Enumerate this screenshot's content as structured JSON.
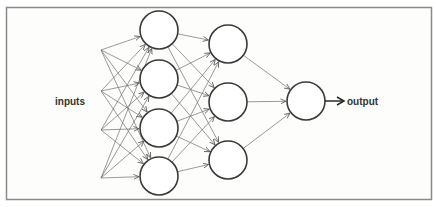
{
  "diagram": {
    "labels": {
      "inputs": "inputs",
      "output": "output"
    },
    "colors": {
      "frame_stroke": "#8a8a88",
      "node_stroke": "#3a3a3a",
      "edge_stroke": "#6e6e6e",
      "text": "#333333"
    },
    "input_points": [
      {
        "x": 101,
        "y": 50
      },
      {
        "x": 101,
        "y": 91
      },
      {
        "x": 101,
        "y": 130
      },
      {
        "x": 101,
        "y": 178
      }
    ],
    "layers": [
      {
        "name": "hidden-layer-1",
        "nodes": [
          {
            "cx": 159,
            "cy": 30,
            "r": 19
          },
          {
            "cx": 159,
            "cy": 79,
            "r": 19
          },
          {
            "cx": 159,
            "cy": 128,
            "r": 19
          },
          {
            "cx": 159,
            "cy": 176,
            "r": 19
          }
        ]
      },
      {
        "name": "hidden-layer-2",
        "nodes": [
          {
            "cx": 228,
            "cy": 44,
            "r": 19
          },
          {
            "cx": 228,
            "cy": 102,
            "r": 19
          },
          {
            "cx": 228,
            "cy": 160,
            "r": 19
          }
        ]
      },
      {
        "name": "output-layer",
        "nodes": [
          {
            "cx": 306,
            "cy": 101,
            "r": 19
          }
        ]
      }
    ],
    "connections": "fully-connected between consecutive layers; each input point connects to every node in hidden-layer-1"
  }
}
